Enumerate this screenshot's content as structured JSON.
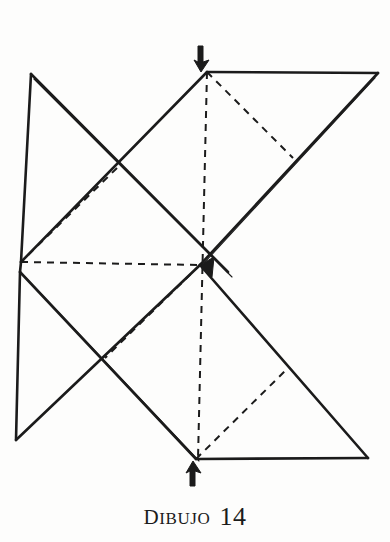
{
  "page": {
    "background_color": "#fdfdfc",
    "ink_color": "#1b1b1b"
  },
  "caption": {
    "label_lead": "D",
    "label_rest": "ibujo",
    "label_full": "DIBUJO",
    "number": "14"
  },
  "figure": {
    "title": "DIBUJO 14",
    "type": "origami-folding-diagram",
    "stroke_color": "#1b1b1b",
    "solid_stroke_width": 2.6,
    "thin_stroke_width": 1.1,
    "dashed_stroke_width": 2.0,
    "dash_pattern": "7,6",
    "vertices": {
      "top_apex": [
        207,
        72
      ],
      "top_right": [
        378,
        73
      ],
      "top_left": [
        31,
        74
      ],
      "mid_left_upper": [
        21,
        262
      ],
      "mid_left_lower": [
        20,
        272
      ],
      "center": [
        200,
        265
      ],
      "bottom_left": [
        16,
        440
      ],
      "bottom_vertex": [
        196,
        459
      ],
      "bottom_right": [
        368,
        458
      ],
      "cross_upper_left": [
        117,
        168
      ],
      "cross_lower_left": [
        105,
        358
      ],
      "cross_upper_right": [
        293,
        158
      ],
      "cross_lower_right": [
        285,
        371
      ]
    },
    "solid_edges": [
      {
        "name": "top-edge",
        "from": [
          207,
          72
        ],
        "to": [
          378,
          73
        ]
      },
      {
        "name": "top-right-diagonal",
        "from": [
          378,
          73
        ],
        "to": [
          200,
          265
        ]
      },
      {
        "name": "top-apex-left-diagonal",
        "from": [
          207,
          72
        ],
        "to": [
          21,
          262
        ]
      },
      {
        "name": "left-upper-vertical",
        "from": [
          31,
          74
        ],
        "to": [
          21,
          262
        ]
      },
      {
        "name": "top-left-diagonal",
        "from": [
          31,
          74
        ],
        "to": [
          228,
          272
        ]
      },
      {
        "name": "left-lower-vertical",
        "from": [
          20,
          272
        ],
        "to": [
          16,
          440
        ]
      },
      {
        "name": "bottom-left-diagonal",
        "from": [
          16,
          440
        ],
        "to": [
          200,
          265
        ]
      },
      {
        "name": "center-bottom-diagonal",
        "from": [
          200,
          265
        ],
        "to": [
          368,
          458
        ]
      },
      {
        "name": "bottom-edge",
        "from": [
          196,
          459
        ],
        "to": [
          368,
          458
        ]
      },
      {
        "name": "left-lower-to-bottom",
        "from": [
          20,
          272
        ],
        "to": [
          196,
          459
        ]
      }
    ],
    "thin_parallel_edges": [
      {
        "name": "thin-upper-right-rim",
        "from": [
          375,
          78
        ],
        "to": [
          205,
          262
        ]
      },
      {
        "name": "thin-lower-left-rim",
        "from": [
          25,
          277
        ],
        "to": [
          199,
          461
        ]
      },
      {
        "name": "thin-top-left-rim",
        "from": [
          34,
          78
        ],
        "to": [
          232,
          276
        ]
      }
    ],
    "dashed_edges": [
      {
        "name": "dashed-vertical-center",
        "from": [
          207,
          72
        ],
        "to": [
          198,
          459
        ]
      },
      {
        "name": "dashed-horizontal-center",
        "from": [
          21,
          262
        ],
        "to": [
          200,
          265
        ]
      },
      {
        "name": "dashed-apex-to-right-cross",
        "from": [
          207,
          72
        ],
        "to": [
          293,
          158
        ]
      },
      {
        "name": "dashed-left-cross-to-midleft",
        "from": [
          117,
          168
        ],
        "to": [
          21,
          262
        ]
      },
      {
        "name": "dashed-center-to-lower-left-cross",
        "from": [
          200,
          265
        ],
        "to": [
          105,
          358
        ]
      },
      {
        "name": "dashed-bottom-to-right-cross",
        "from": [
          196,
          459
        ],
        "to": [
          285,
          371
        ]
      }
    ],
    "arrows": [
      {
        "name": "fold-arrow-top",
        "direction": "down",
        "tip": [
          202,
          70
        ],
        "tail": [
          198,
          48
        ],
        "label": "fold down at top apex"
      },
      {
        "name": "fold-arrow-bottom",
        "direction": "up",
        "tip": [
          194,
          461
        ],
        "tail": [
          190,
          484
        ],
        "label": "fold up at bottom vertex"
      }
    ]
  }
}
